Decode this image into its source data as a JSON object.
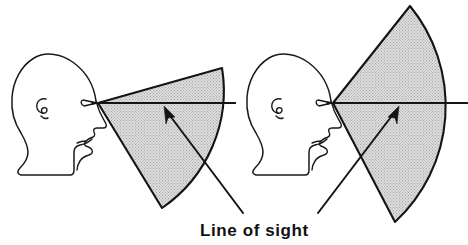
{
  "figure": {
    "title": "Line of sight",
    "caption": {
      "text": "Line of sight",
      "x": 200,
      "y": 236,
      "font_size_px": 17,
      "weight": "bold"
    },
    "background_color": "#ffffff",
    "ink_color": "#141414",
    "fan_fill_color": "#cdcdcd",
    "canvas": {
      "width": 468,
      "height": 245
    },
    "figures": [
      {
        "id": "left-figure",
        "label": "normal line of sight",
        "head": {
          "eye_point": {
            "x": 98,
            "y": 103
          },
          "facing": "right"
        },
        "vision_fan": {
          "apex": {
            "x": 98,
            "y": 103
          },
          "upper_vertex": {
            "x": 222,
            "y": 68
          },
          "lower_vertex": {
            "x": 162,
            "y": 208
          },
          "arc_bulge": "right",
          "fill": "#cdcdcd",
          "stroke": "#141414"
        },
        "sight_line": {
          "from": {
            "x": 98,
            "y": 103
          },
          "to": {
            "x": 236,
            "y": 103
          }
        },
        "leader": {
          "tip": {
            "x": 165,
            "y": 110
          },
          "tail": {
            "x": 243,
            "y": 213
          }
        }
      },
      {
        "id": "right-figure",
        "label": "wide line of sight",
        "head": {
          "eye_point": {
            "x": 333,
            "y": 103
          },
          "facing": "right"
        },
        "vision_fan": {
          "apex": {
            "x": 333,
            "y": 103
          },
          "upper_vertex": {
            "x": 410,
            "y": 6
          },
          "lower_vertex": {
            "x": 395,
            "y": 222
          },
          "arc_bulge": "right",
          "fill": "#cdcdcd",
          "stroke": "#141414"
        },
        "sight_line": {
          "from": {
            "x": 333,
            "y": 103
          },
          "to": {
            "x": 468,
            "y": 103
          }
        },
        "leader": {
          "tip": {
            "x": 398,
            "y": 110
          },
          "tail": {
            "x": 318,
            "y": 213
          }
        }
      }
    ]
  }
}
